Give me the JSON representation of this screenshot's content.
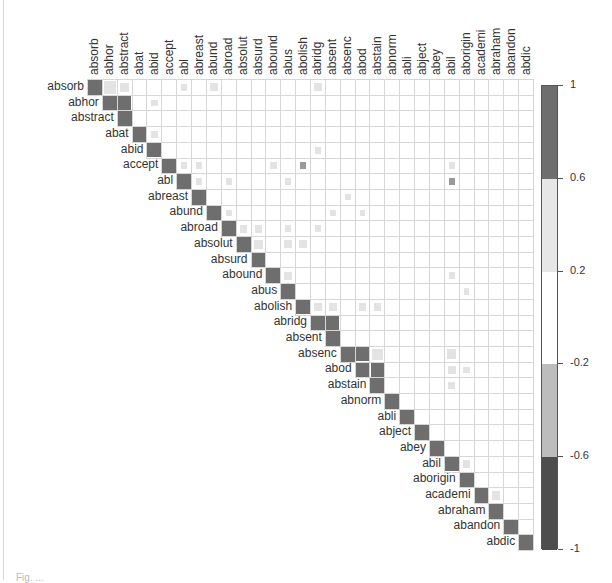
{
  "chart_data": {
    "type": "heatmap",
    "title": "",
    "subtitle": "",
    "layout": "upper-triangular correlation matrix",
    "labels": [
      "absorb",
      "abhor",
      "abstract",
      "abat",
      "abid",
      "accept",
      "abl",
      "abreast",
      "abund",
      "abroad",
      "absolut",
      "absurd",
      "abound",
      "abus",
      "abolish",
      "abridg",
      "absent",
      "absenc",
      "abod",
      "abstain",
      "abnorm",
      "abli",
      "abject",
      "abey",
      "abil",
      "aborigin",
      "academi",
      "abraham",
      "abandon",
      "abdic"
    ],
    "value_range": [
      -1,
      1
    ],
    "colorbar": {
      "ticks": [
        "1",
        "0.6",
        "0.2",
        "-0.2",
        "-0.6",
        "-1"
      ],
      "bands": [
        {
          "from": 0.6,
          "to": 1.0,
          "color": "#6e6e6e"
        },
        {
          "from": 0.2,
          "to": 0.6,
          "color": "#e6e6e6"
        },
        {
          "from": -0.2,
          "to": 0.2,
          "color": "#ffffff"
        },
        {
          "from": -0.6,
          "to": -0.2,
          "color": "#bdbdbd"
        },
        {
          "from": -1.0,
          "to": -0.6,
          "color": "#4d4d4d"
        }
      ]
    },
    "diagonal_value": 1,
    "cells": [
      {
        "row": 0,
        "col": 1,
        "value": 0.35,
        "size": 0.9
      },
      {
        "row": 0,
        "col": 2,
        "value": 0.3,
        "size": 0.7
      },
      {
        "row": 0,
        "col": 6,
        "value": 0.25,
        "size": 0.5
      },
      {
        "row": 0,
        "col": 8,
        "value": 0.3,
        "size": 0.6
      },
      {
        "row": 0,
        "col": 15,
        "value": 0.3,
        "size": 0.6
      },
      {
        "row": 1,
        "col": 2,
        "value": 0.95,
        "size": 1.0
      },
      {
        "row": 1,
        "col": 4,
        "value": 0.25,
        "size": 0.5
      },
      {
        "row": 3,
        "col": 4,
        "value": 0.25,
        "size": 0.5
      },
      {
        "row": 4,
        "col": 15,
        "value": 0.25,
        "size": 0.5
      },
      {
        "row": 5,
        "col": 6,
        "value": 0.25,
        "size": 0.5
      },
      {
        "row": 5,
        "col": 7,
        "value": 0.25,
        "size": 0.5
      },
      {
        "row": 5,
        "col": 12,
        "value": 0.25,
        "size": 0.5
      },
      {
        "row": 5,
        "col": 14,
        "value": 0.55,
        "size": 0.5
      },
      {
        "row": 5,
        "col": 24,
        "value": 0.25,
        "size": 0.5
      },
      {
        "row": 6,
        "col": 7,
        "value": 0.25,
        "size": 0.5
      },
      {
        "row": 6,
        "col": 9,
        "value": 0.25,
        "size": 0.5
      },
      {
        "row": 6,
        "col": 13,
        "value": 0.25,
        "size": 0.45
      },
      {
        "row": 6,
        "col": 24,
        "value": 0.5,
        "size": 0.5
      },
      {
        "row": 7,
        "col": 17,
        "value": 0.25,
        "size": 0.45
      },
      {
        "row": 8,
        "col": 9,
        "value": 0.25,
        "size": 0.45
      },
      {
        "row": 8,
        "col": 16,
        "value": 0.25,
        "size": 0.45
      },
      {
        "row": 8,
        "col": 18,
        "value": 0.25,
        "size": 0.45
      },
      {
        "row": 9,
        "col": 10,
        "value": 0.3,
        "size": 0.6
      },
      {
        "row": 9,
        "col": 11,
        "value": 0.3,
        "size": 0.6
      },
      {
        "row": 9,
        "col": 13,
        "value": 0.25,
        "size": 0.5
      },
      {
        "row": 9,
        "col": 15,
        "value": 0.25,
        "size": 0.5
      },
      {
        "row": 10,
        "col": 11,
        "value": 0.3,
        "size": 0.7
      },
      {
        "row": 10,
        "col": 13,
        "value": 0.3,
        "size": 0.6
      },
      {
        "row": 10,
        "col": 14,
        "value": 0.3,
        "size": 0.6
      },
      {
        "row": 12,
        "col": 13,
        "value": 0.3,
        "size": 0.6
      },
      {
        "row": 12,
        "col": 24,
        "value": 0.25,
        "size": 0.5
      },
      {
        "row": 13,
        "col": 25,
        "value": 0.25,
        "size": 0.45
      },
      {
        "row": 14,
        "col": 15,
        "value": 0.3,
        "size": 0.6
      },
      {
        "row": 14,
        "col": 16,
        "value": 0.3,
        "size": 0.6
      },
      {
        "row": 14,
        "col": 18,
        "value": 0.3,
        "size": 0.55
      },
      {
        "row": 14,
        "col": 19,
        "value": 0.3,
        "size": 0.6
      },
      {
        "row": 15,
        "col": 16,
        "value": 0.95,
        "size": 1.0
      },
      {
        "row": 17,
        "col": 18,
        "value": 0.9,
        "size": 1.0
      },
      {
        "row": 17,
        "col": 19,
        "value": 0.35,
        "size": 0.8
      },
      {
        "row": 18,
        "col": 19,
        "value": 0.9,
        "size": 1.0
      },
      {
        "row": 18,
        "col": 24,
        "value": 0.3,
        "size": 0.6
      },
      {
        "row": 18,
        "col": 25,
        "value": 0.25,
        "size": 0.5
      },
      {
        "row": 19,
        "col": 24,
        "value": 0.3,
        "size": 0.55
      },
      {
        "row": 17,
        "col": 24,
        "value": 0.3,
        "size": 0.7
      },
      {
        "row": 24,
        "col": 25,
        "value": 0.3,
        "size": 0.6
      },
      {
        "row": 26,
        "col": 27,
        "value": 0.3,
        "size": 0.6
      }
    ],
    "xlabel": "",
    "ylabel": "",
    "grid": true,
    "legend_position": "right"
  },
  "colors": {
    "diagonal": "#6e6e6e",
    "strong": "#6e6e6e",
    "medium": "#9a9a9a",
    "light": "#e3e3e3",
    "gridline": "#d6d6d6"
  },
  "caption": "Fig. ..."
}
